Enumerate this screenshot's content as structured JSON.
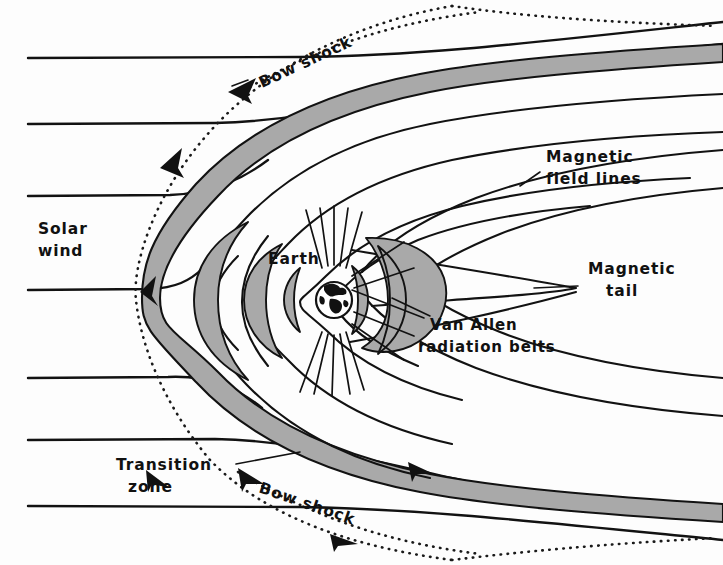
{
  "figure": {
    "background_color": "#fdfdfd",
    "ink_color": "#121212",
    "shaded_region_color": "#a9a9a9"
  },
  "labels": {
    "solar_wind": {
      "line1": "Solar",
      "line2": "wind"
    },
    "bow_shock_top": "Bow shock",
    "bow_shock_bottom": "Bow shock",
    "transition_zone": {
      "line1": "Transition",
      "line2": "zone"
    },
    "magnetic_field_lines": {
      "line1": "Magnetic",
      "line2": "field lines"
    },
    "magnetic_tail": {
      "line1": "Magnetic",
      "line2": "tail"
    },
    "van_allen": {
      "line1": "Van Allen",
      "line2": "radiation belts"
    },
    "earth": "Earth"
  },
  "features": {
    "bow_shock": "dotted-curve",
    "transition_zone": "gray-band",
    "magnetopause": "solid-curve",
    "van_allen_belts": "gray-crescents",
    "earth_globe": "circle-with-continents",
    "solar_wind_streamlines": "horizontal-lines-deflected",
    "flow_arrows": "arrowheads-along-shock"
  }
}
